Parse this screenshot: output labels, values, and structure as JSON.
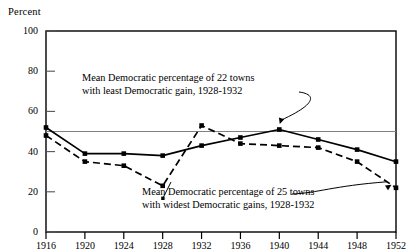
{
  "chart_data": {
    "type": "line",
    "title": "",
    "ylabel": "Percent",
    "xlabel": "",
    "ylim": [
      0,
      100
    ],
    "yticks": [
      0,
      20,
      40,
      60,
      80,
      100
    ],
    "x": [
      1916,
      1920,
      1924,
      1928,
      1932,
      1936,
      1940,
      1944,
      1948,
      1952
    ],
    "xticklabels": [
      "1916",
      "1920",
      "1924",
      "1928",
      "1932",
      "1936",
      "1940",
      "1944",
      "1948",
      "1952"
    ],
    "grid": false,
    "legend": "none",
    "reference_line": {
      "value": 50,
      "orientation": "horizontal",
      "color": "#808080"
    },
    "series": [
      {
        "name": "Mean Democratic percentage of 22 towns with least Democratic gain, 1928-1932",
        "style": "solid",
        "marker": "square",
        "color": "#000000",
        "values": [
          52,
          39,
          39,
          38,
          43,
          47,
          51,
          46,
          41,
          35
        ]
      },
      {
        "name": "Mean Democratic percentage of 25 towns with widest Democratic gains, 1928-1932",
        "style": "dashed",
        "marker": "square",
        "color": "#000000",
        "values": [
          48,
          35,
          33,
          23,
          53,
          44,
          43,
          42,
          35,
          22
        ]
      }
    ],
    "annotations": [
      {
        "id": "annotation-least-gain",
        "line1": "Mean Democratic percentage of  22 towns",
        "line2": "with least Democratic gain, 1928-1932",
        "points_to_year": 1940
      },
      {
        "id": "annotation-widest-gain",
        "line1": "Mean Democratic percentage of  25 towns",
        "line2": "with widest Democratic gains,  1928-1932",
        "points_to_year": 1952
      }
    ]
  }
}
